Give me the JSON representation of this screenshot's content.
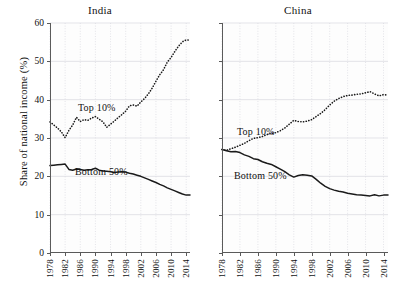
{
  "figure": {
    "ylabel": "Share of national income (%)",
    "background": "#ffffff",
    "line_color": "#1a1a1a",
    "grid_color": "#d9d9e0",
    "axis_color": "#5a5a5a"
  },
  "chart_data": [
    {
      "type": "line",
      "title": "India",
      "xlabel": "",
      "ylabel": "Share of national income (%)",
      "xlim": [
        1978,
        2015
      ],
      "ylim": [
        0,
        60
      ],
      "yticks": [
        0,
        10,
        20,
        30,
        40,
        50,
        60
      ],
      "xticks": [
        1978,
        1982,
        1986,
        1990,
        1994,
        1998,
        2002,
        2006,
        2010,
        2014
      ],
      "grid": true,
      "legend": "inline-annotations",
      "x": [
        1978,
        1979,
        1980,
        1981,
        1982,
        1983,
        1984,
        1985,
        1986,
        1987,
        1988,
        1989,
        1990,
        1991,
        1992,
        1993,
        1994,
        1995,
        1996,
        1997,
        1998,
        1999,
        2000,
        2001,
        2002,
        2003,
        2004,
        2005,
        2006,
        2007,
        2008,
        2009,
        2010,
        2011,
        2012,
        2013,
        2014,
        2015
      ],
      "series": [
        {
          "name": "Top 10%",
          "style": "dotted",
          "annotation": "Top 10%",
          "values": [
            34.2,
            33.4,
            32.6,
            31.6,
            30.1,
            32.0,
            33.4,
            35.4,
            34.3,
            34.8,
            34.6,
            35.2,
            35.6,
            34.9,
            34.2,
            32.8,
            33.6,
            34.4,
            35.3,
            36.1,
            37.0,
            38.4,
            38.6,
            38.3,
            39.4,
            40.3,
            41.5,
            43.0,
            44.8,
            46.5,
            47.8,
            49.8,
            51.0,
            52.6,
            54.0,
            55.1,
            55.6,
            55.5
          ]
        },
        {
          "name": "Bottom 50%",
          "style": "solid",
          "annotation": "Bottom 50%",
          "values": [
            22.8,
            22.9,
            23.0,
            23.1,
            23.2,
            21.8,
            21.6,
            21.9,
            21.8,
            21.6,
            21.7,
            21.8,
            22.1,
            21.6,
            21.4,
            21.3,
            21.2,
            21.0,
            21.1,
            21.2,
            21.1,
            20.8,
            20.6,
            20.3,
            20.0,
            19.6,
            19.2,
            18.8,
            18.4,
            17.9,
            17.5,
            17.0,
            16.6,
            16.2,
            15.8,
            15.4,
            15.1,
            15.1
          ]
        }
      ]
    },
    {
      "type": "line",
      "title": "China",
      "xlabel": "",
      "ylabel": "Share of national income (%)",
      "xlim": [
        1978,
        2015
      ],
      "ylim": [
        0,
        60
      ],
      "yticks": [
        0,
        10,
        20,
        30,
        40,
        50,
        60
      ],
      "xticks": [
        1978,
        1982,
        1986,
        1990,
        1994,
        1998,
        2002,
        2006,
        2010,
        2014
      ],
      "grid": true,
      "legend": "inline-annotations",
      "x": [
        1978,
        1979,
        1980,
        1981,
        1982,
        1983,
        1984,
        1985,
        1986,
        1987,
        1988,
        1989,
        1990,
        1991,
        1992,
        1993,
        1994,
        1995,
        1996,
        1997,
        1998,
        1999,
        2000,
        2001,
        2002,
        2003,
        2004,
        2005,
        2006,
        2007,
        2008,
        2009,
        2010,
        2011,
        2012,
        2013,
        2014,
        2015
      ],
      "series": [
        {
          "name": "Top 10%",
          "style": "dotted",
          "annotation": "Top 10%",
          "values": [
            27.0,
            26.8,
            27.2,
            27.6,
            28.1,
            28.6,
            29.3,
            29.9,
            30.1,
            30.4,
            30.9,
            31.2,
            31.4,
            31.9,
            32.6,
            33.6,
            34.6,
            34.3,
            34.2,
            34.4,
            34.8,
            35.6,
            36.4,
            37.4,
            38.6,
            39.6,
            40.3,
            40.8,
            41.1,
            41.2,
            41.4,
            41.5,
            41.8,
            42.1,
            41.5,
            41.0,
            41.3,
            41.2
          ]
        },
        {
          "name": "Bottom 50%",
          "style": "solid",
          "annotation": "Bottom 50%",
          "values": [
            27.0,
            26.7,
            26.4,
            26.5,
            26.2,
            25.6,
            25.2,
            24.6,
            24.4,
            23.8,
            23.4,
            23.1,
            22.5,
            21.9,
            21.2,
            20.4,
            19.8,
            20.2,
            20.4,
            20.3,
            20.1,
            19.2,
            18.2,
            17.4,
            16.8,
            16.4,
            16.1,
            15.9,
            15.6,
            15.4,
            15.2,
            15.1,
            15.0,
            14.9,
            15.2,
            14.9,
            15.1,
            15.1
          ]
        }
      ]
    }
  ],
  "annotations": {
    "india_top": "Top 10%",
    "india_bottom": "Bottom 50%",
    "china_top": "Top 10%",
    "china_bottom": "Bottom 50%"
  }
}
